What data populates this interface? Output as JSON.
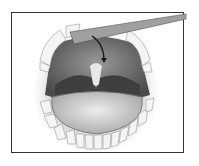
{
  "illustration": {
    "subject": "open mouth with tongue depressor and arrow pointing to soft palate",
    "frame_color": "#333333",
    "colors": {
      "mouth_dark": "#5a5a5a",
      "palate": "#8a8a8a",
      "uvula": "#e6e6e6",
      "tongue": "#cfcfcf",
      "teeth": "#f2f2f2",
      "depressor": "#9a9a9a",
      "arrow": "#1a1a1a"
    }
  }
}
